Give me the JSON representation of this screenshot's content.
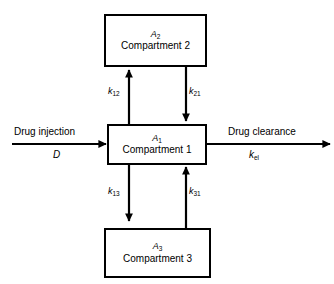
{
  "diagram": {
    "type": "three-compartment-pharmacokinetic-model",
    "boxes": [
      {
        "id": "compartment-2",
        "amount": "A",
        "amount_subscript": "2",
        "label": "Compartment 2"
      },
      {
        "id": "compartment-1",
        "amount": "A",
        "amount_subscript": "1",
        "label": "Compartment 1"
      },
      {
        "id": "compartment-3",
        "amount": "A",
        "amount_subscript": "3",
        "label": "Compartment 3"
      }
    ],
    "rate_constants": [
      {
        "id": "k12",
        "symbol": "k",
        "subscript": "12",
        "direction": "up",
        "from": "Compartment 1",
        "to": "Compartment 2"
      },
      {
        "id": "k21",
        "symbol": "k",
        "subscript": "21",
        "direction": "down",
        "from": "Compartment 2",
        "to": "Compartment 1"
      },
      {
        "id": "k13",
        "symbol": "k",
        "subscript": "13",
        "direction": "down",
        "from": "Compartment 1",
        "to": "Compartment 3"
      },
      {
        "id": "k31",
        "symbol": "k",
        "subscript": "31",
        "direction": "up",
        "from": "Compartment 3",
        "to": "Compartment 1"
      }
    ],
    "input": {
      "title": "Drug injection",
      "symbol": "D",
      "symbol_subscript": ""
    },
    "output": {
      "title": "Drug clearance",
      "symbol": "k",
      "symbol_subscript": "el"
    },
    "colors": {
      "stroke": "#000000",
      "background": "#ffffff",
      "text": "#000000"
    }
  }
}
